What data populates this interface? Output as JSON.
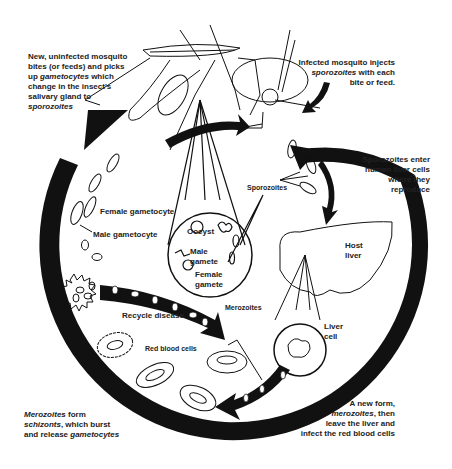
{
  "diagram": {
    "colors": {
      "ink": "#111111",
      "text": "#222222",
      "background": "#ffffff"
    },
    "captions": {
      "new_mosquito": {
        "line1": "New, uninfected mosquito",
        "line2": "bites (or feeds) and picks",
        "line3_pre": "up ",
        "line3_em": "gametocytes",
        "line3_post": " which",
        "line4": "change in the insect's",
        "line5": "salivary gland to",
        "line6_em": "sporozoites"
      },
      "infected_mosquito": {
        "line1": "Infected mosquito injects",
        "line2_em": "sporozoites",
        "line2_post": " with each",
        "line3": "bite or feed."
      },
      "sporozoites_enter": {
        "line1": "Sporozoites enter",
        "line2": "human liver cells",
        "line3": "where they",
        "line4": "reproduce"
      },
      "new_form": {
        "line1": "A new form,",
        "line2_em": "merozoites",
        "line2_post": ", then",
        "line3": "leave the liver and",
        "line4": "infect the red blood cells"
      },
      "merozoites_form": {
        "line1_em": "Merozoites",
        "line1_post": " form",
        "line2_em": "schizonts",
        "line2_post": ", which burst",
        "line3_pre": "and release ",
        "line3_em": "gametocytes"
      }
    },
    "labels": {
      "female_gametocyte": "Female gametocyte",
      "male_gametocyte": "Male gametocyte",
      "oocyst": "Oocyst",
      "male_gamete": "Male\ngamete",
      "male_gamete_1": "Male",
      "male_gamete_2": "gamete",
      "female_gamete_1": "Female",
      "female_gamete_2": "gamete",
      "sporozoites": "Sporozoites",
      "host_liver_1": "Host",
      "host_liver_2": "liver",
      "liver_cell_1": "Liver",
      "liver_cell_2": "cell",
      "merozoites": "Merozoites",
      "recycle_disease": "Recycle disease",
      "red_blood_cells": "Red blood cells"
    }
  }
}
